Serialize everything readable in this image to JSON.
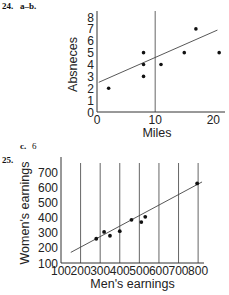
{
  "labels": {
    "problem_24": "24.",
    "problem_24_parts": "a–b.",
    "part_c_letter": "c.",
    "part_c_value": "6",
    "problem_25": "25."
  },
  "chart_data": [
    {
      "type": "scatter",
      "title": "",
      "xlabel": "Miles",
      "ylabel": "Absneces",
      "xlim": [
        0,
        22
      ],
      "ylim": [
        0,
        8
      ],
      "xticks": [
        0,
        10,
        20
      ],
      "xtick_labels": [
        "0",
        "10",
        "20"
      ],
      "yticks": [
        0,
        1,
        2,
        3,
        4,
        5,
        6,
        7,
        8
      ],
      "ytick_labels": [
        "0",
        "1",
        "2",
        "3",
        "4",
        "5",
        "6",
        "7",
        "8"
      ],
      "grid": false,
      "vertical_reference_line": 10,
      "points": [
        {
          "x": 2,
          "y": 2
        },
        {
          "x": 8,
          "y": 3
        },
        {
          "x": 8,
          "y": 4
        },
        {
          "x": 8,
          "y": 5
        },
        {
          "x": 11,
          "y": 4
        },
        {
          "x": 15,
          "y": 5
        },
        {
          "x": 17,
          "y": 7
        },
        {
          "x": 21,
          "y": 5
        }
      ],
      "trend_line": {
        "x": [
          0.3,
          20.7
        ],
        "y": [
          2.5,
          6.9
        ]
      }
    },
    {
      "type": "scatter",
      "title": "",
      "xlabel": "Men's earnings",
      "ylabel": "Women's earnings",
      "xlim": [
        100,
        830
      ],
      "ylim": [
        100,
        760
      ],
      "xticks": [
        100,
        200,
        300,
        400,
        500,
        600,
        700,
        800
      ],
      "xtick_labels": [
        "100",
        "200",
        "300",
        "400",
        "500",
        "600",
        "700",
        "800"
      ],
      "yticks": [
        100,
        200,
        300,
        400,
        500,
        600,
        700
      ],
      "ytick_labels": [
        "100",
        "200",
        "300",
        "400",
        "500",
        "600",
        "700"
      ],
      "grid": "vertical",
      "points": [
        {
          "x": 280,
          "y": 260
        },
        {
          "x": 320,
          "y": 305
        },
        {
          "x": 350,
          "y": 280
        },
        {
          "x": 400,
          "y": 310
        },
        {
          "x": 460,
          "y": 385
        },
        {
          "x": 510,
          "y": 370
        },
        {
          "x": 530,
          "y": 405
        },
        {
          "x": 795,
          "y": 625
        }
      ],
      "trend_line": {
        "x": [
          150,
          820
        ],
        "y": [
          170,
          635
        ]
      }
    }
  ]
}
